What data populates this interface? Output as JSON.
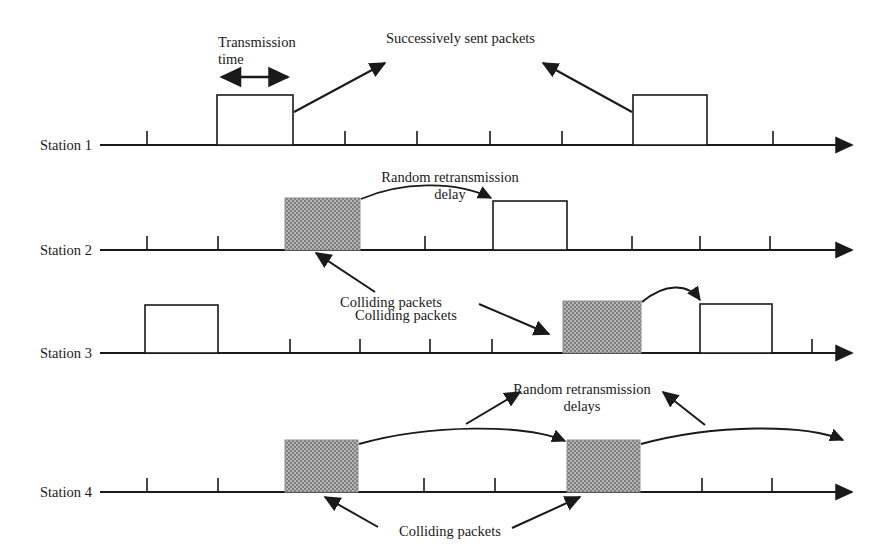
{
  "diagram": {
    "colors": {
      "line": "#1a1a1a",
      "collision_fill": "#999999",
      "packet_fill": "#ffffff",
      "background": "#ffffff"
    },
    "stations": [
      {
        "id": "station-1",
        "label": "Station 1",
        "axis_y": 145
      },
      {
        "id": "station-2",
        "label": "Station 2",
        "axis_y": 250
      },
      {
        "id": "station-3",
        "label": "Station 3",
        "axis_y": 353
      },
      {
        "id": "station-4",
        "label": "Station 4",
        "axis_y": 492
      }
    ],
    "axis": {
      "x_start": 100,
      "x_end": 848,
      "tick_spacing": 72,
      "tick_height": 14
    },
    "packets": [
      {
        "station": 1,
        "type": "sent",
        "x": 217,
        "width": 76,
        "height": 50,
        "name": "station1-packet-1"
      },
      {
        "station": 1,
        "type": "sent",
        "x": 633,
        "width": 74,
        "height": 50,
        "name": "station1-packet-2"
      },
      {
        "station": 2,
        "type": "colliding",
        "x": 285,
        "width": 75,
        "height": 52,
        "name": "station2-collision-packet"
      },
      {
        "station": 2,
        "type": "sent",
        "x": 493,
        "width": 74,
        "height": 49,
        "name": "station2-retransmit-packet"
      },
      {
        "station": 3,
        "type": "sent",
        "x": 145,
        "width": 73,
        "height": 48,
        "name": "station3-packet-1"
      },
      {
        "station": 3,
        "type": "colliding",
        "x": 563,
        "width": 78,
        "height": 52,
        "name": "station3-collision-packet"
      },
      {
        "station": 3,
        "type": "sent",
        "x": 700,
        "width": 72,
        "height": 49,
        "name": "station3-retransmit-packet"
      },
      {
        "station": 4,
        "type": "colliding",
        "x": 285,
        "width": 73,
        "height": 52,
        "name": "station4-collision-packet-1"
      },
      {
        "station": 4,
        "type": "colliding",
        "x": 567,
        "width": 73,
        "height": 52,
        "name": "station4-collision-packet-2"
      }
    ],
    "annotations": {
      "transmission_time": "Transmission\ntime",
      "successively_sent_packets": "Successively sent packets",
      "random_retransmission_delay": "Random retransmission\ndelay",
      "colliding_packets_2": "Colliding packets",
      "colliding_packets_3": "Colliding packets",
      "random_retransmission_delays": "Random retransmission\ndelays",
      "colliding_packets_4": "Colliding packets"
    }
  }
}
